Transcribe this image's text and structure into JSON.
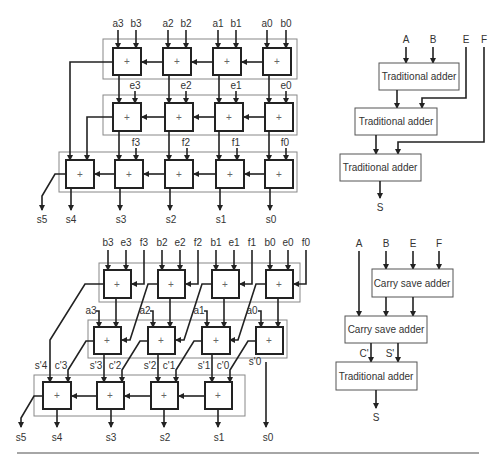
{
  "top_left": {
    "row1_inputs": [
      "a3",
      "b3",
      "a2",
      "b2",
      "a1",
      "b1",
      "a0",
      "b0"
    ],
    "row2_inputs": [
      "e3",
      "e2",
      "e1",
      "e0"
    ],
    "row3_inputs": [
      "f3",
      "f2",
      "f1",
      "f0"
    ],
    "outputs": [
      "s5",
      "s4",
      "s3",
      "s2",
      "s1",
      "s0"
    ],
    "adder_symbol": "+"
  },
  "top_right": {
    "inputs": [
      "A",
      "B",
      "E",
      "F"
    ],
    "blocks": [
      "Traditional adder",
      "Traditional adder",
      "Traditional adder"
    ],
    "output": "S"
  },
  "bottom_left": {
    "row1_inputs": [
      "b3",
      "e3",
      "f3",
      "b2",
      "e2",
      "f2",
      "b1",
      "e1",
      "f1",
      "b0",
      "e0",
      "f0"
    ],
    "row2_inputs": [
      "a3",
      "a2",
      "a1",
      "a0"
    ],
    "intermediate": [
      "s'4",
      "c'3",
      "s'3",
      "c'2",
      "s'2",
      "c'1",
      "s'1",
      "c'0",
      "s'0"
    ],
    "outputs": [
      "s5",
      "s4",
      "s3",
      "s2",
      "s1",
      "s0"
    ],
    "adder_symbol": "+"
  },
  "bottom_right": {
    "inputs": [
      "A",
      "B",
      "E",
      "F"
    ],
    "blocks": [
      "Carry save adder",
      "Carry save adder",
      "Traditional adder"
    ],
    "intermediate": [
      "C'",
      "S'"
    ],
    "output": "S"
  }
}
